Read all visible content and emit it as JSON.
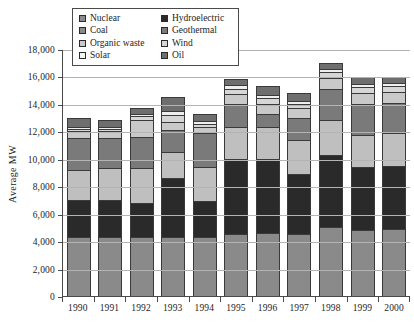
{
  "chart_data": {
    "type": "bar",
    "title": "",
    "xlabel": "",
    "ylabel": "Average MW",
    "ylim": [
      0,
      18000
    ],
    "ytick_step": 2000,
    "ytick_labels": [
      "18,000",
      "16,000",
      "14,000",
      "12,000",
      "10,000",
      "8,000",
      "6,000",
      "4,000",
      "2,000",
      "0"
    ],
    "grid": true,
    "legend_position": "top-left-inside",
    "stacked": true,
    "categories": [
      "1990",
      "1991",
      "1992",
      "1993",
      "1994",
      "1995",
      "1996",
      "1997",
      "1998",
      "1999",
      "2000"
    ],
    "series": [
      {
        "name": "Nuclear",
        "color": "#8a8a8a",
        "values": [
          4300,
          4300,
          4300,
          4300,
          4300,
          4500,
          4600,
          4500,
          5000,
          4800,
          4900
        ]
      },
      {
        "name": "Hydroelectric",
        "color": "#2a2a2a",
        "values": [
          2700,
          2700,
          2500,
          4300,
          2600,
          5500,
          5400,
          4400,
          5300,
          4600,
          4600
        ]
      },
      {
        "name": "Coal",
        "color": "#bfbfbf",
        "values": [
          2200,
          2300,
          2500,
          1900,
          2500,
          2300,
          2300,
          2500,
          2500,
          2300,
          2400
        ]
      },
      {
        "name": "Geothermal",
        "color": "#7a7a7a",
        "values": [
          2300,
          2200,
          2300,
          1600,
          2500,
          1700,
          1000,
          1600,
          2300,
          2300,
          2200
        ]
      },
      {
        "name": "Organic waste",
        "color": "#c9c9c9",
        "values": [
          500,
          500,
          1200,
          600,
          400,
          700,
          700,
          700,
          800,
          800,
          800
        ]
      },
      {
        "name": "Wind",
        "color": "#d6d6d6",
        "values": [
          200,
          200,
          300,
          500,
          250,
          400,
          400,
          300,
          400,
          400,
          400
        ]
      },
      {
        "name": "Solar",
        "color": "#efefef",
        "values": [
          150,
          150,
          200,
          250,
          200,
          250,
          250,
          200,
          250,
          250,
          250
        ]
      },
      {
        "name": "Oil",
        "color": "#6e6e6e",
        "values": [
          650,
          450,
          400,
          1050,
          550,
          450,
          650,
          600,
          450,
          550,
          450
        ]
      }
    ],
    "totals": [
      13000,
      12800,
      13700,
      14500,
      13300,
      15800,
      15300,
      14800,
      17000,
      16000,
      16000
    ],
    "legend_entries": [
      {
        "label": "Nuclear",
        "color": "#8a8a8a"
      },
      {
        "label": "Hydroelectric",
        "color": "#2a2a2a"
      },
      {
        "label": "Coal",
        "color": "#8a8a8a"
      },
      {
        "label": "Geothermal",
        "color": "#7a7a7a"
      },
      {
        "label": "Organic waste",
        "color": "#c9c9c9"
      },
      {
        "label": "Wind",
        "color": "#d6d6d6"
      },
      {
        "label": "Solar",
        "color": "#f5f5f5"
      },
      {
        "label": "Oil",
        "color": "#6e6e6e"
      }
    ]
  }
}
